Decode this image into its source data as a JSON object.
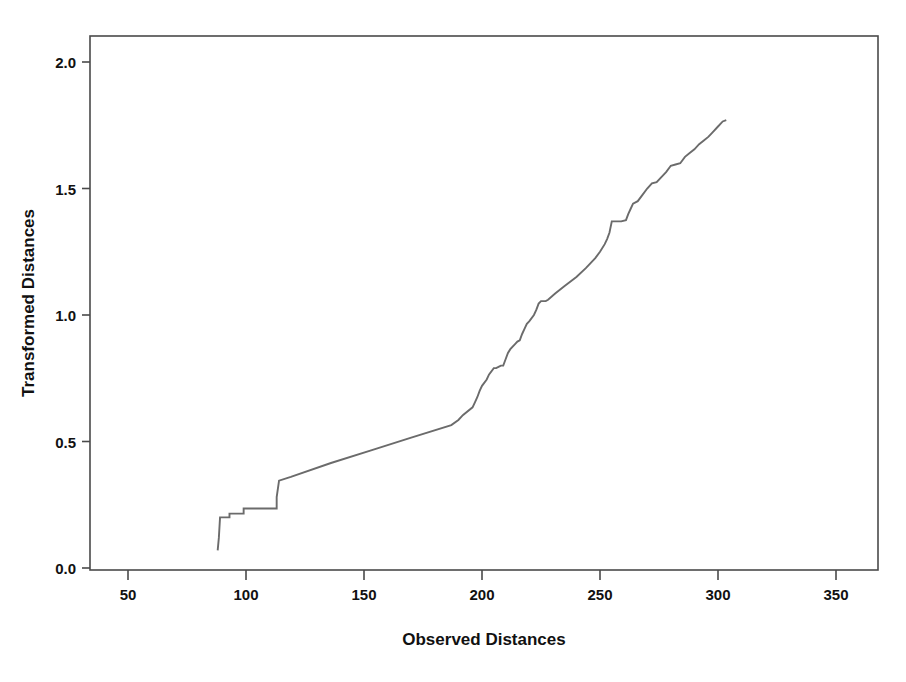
{
  "chart_data": {
    "type": "line",
    "title": "",
    "subtitle": "",
    "xlabel": "Observed Distances",
    "ylabel": "Transformed Distances",
    "xlim": [
      35,
      370
    ],
    "ylim": [
      -0.05,
      2.12
    ],
    "xticks": [
      50,
      100,
      150,
      200,
      250,
      300,
      350
    ],
    "xtick_labels": [
      "50",
      "100",
      "150",
      "200",
      "250",
      "300",
      "350"
    ],
    "yticks": [
      0.0,
      0.5,
      1.0,
      1.5,
      2.0
    ],
    "ytick_labels": [
      "0.0",
      "0.5",
      "1.0",
      "1.5",
      "2.0"
    ],
    "grid": false,
    "legend": null,
    "legend_position": "none",
    "line_color": "#6b6b6b",
    "frame_color": "#4a4a4a",
    "background_color": "#ffffff",
    "series": [
      {
        "name": "Transformation plot",
        "x": [
          88,
          88.5,
          89,
          93,
          93,
          99,
          99,
          113,
          113,
          114,
          119,
          136,
          153,
          170,
          187,
          190,
          191.5,
          192,
          196,
          197,
          198,
          199,
          200,
          202,
          203,
          205,
          206,
          207,
          208,
          209,
          210,
          211,
          212,
          214,
          215,
          216,
          217,
          218,
          219,
          220,
          222,
          223,
          224,
          225,
          227,
          228,
          231,
          235,
          240,
          244,
          248,
          250,
          252,
          253,
          254,
          255,
          257,
          259,
          261,
          262,
          263,
          264,
          266,
          268,
          270,
          272,
          274,
          276,
          278,
          280,
          282,
          284,
          286,
          288,
          290,
          292,
          294,
          296,
          298,
          300,
          302,
          303.5
        ],
        "y": [
          0.07,
          0.12,
          0.2,
          0.2,
          0.215,
          0.215,
          0.235,
          0.235,
          0.28,
          0.345,
          0.36,
          0.415,
          0.465,
          0.515,
          0.565,
          0.585,
          0.6,
          0.605,
          0.635,
          0.655,
          0.675,
          0.7,
          0.72,
          0.745,
          0.765,
          0.79,
          0.79,
          0.795,
          0.8,
          0.8,
          0.825,
          0.85,
          0.865,
          0.885,
          0.895,
          0.9,
          0.925,
          0.945,
          0.965,
          0.975,
          1.0,
          1.02,
          1.045,
          1.055,
          1.055,
          1.06,
          1.085,
          1.115,
          1.15,
          1.185,
          1.225,
          1.25,
          1.28,
          1.3,
          1.325,
          1.37,
          1.37,
          1.37,
          1.375,
          1.4,
          1.42,
          1.44,
          1.45,
          1.475,
          1.5,
          1.52,
          1.525,
          1.545,
          1.565,
          1.59,
          1.595,
          1.6,
          1.625,
          1.64,
          1.655,
          1.675,
          1.69,
          1.705,
          1.725,
          1.745,
          1.765,
          1.77
        ]
      }
    ]
  }
}
